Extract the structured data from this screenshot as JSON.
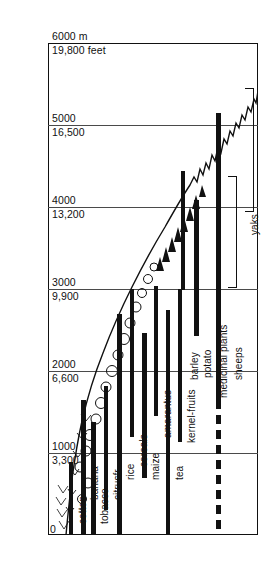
{
  "figure": {
    "title": "Altitudinal zonation of crops and livestock in the Himalaya",
    "unit_primary": "m",
    "unit_secondary": "feet"
  },
  "axis": {
    "ticks": [
      {
        "meters": "6000 m",
        "feet": "19,800 feet",
        "y": 43
      },
      {
        "meters": "5000",
        "feet": "16,500",
        "y": 125
      },
      {
        "meters": "4000",
        "feet": "13,200",
        "y": 207
      },
      {
        "meters": "3000",
        "feet": "9,900",
        "y": 289
      },
      {
        "meters": "2000",
        "feet": "6,600",
        "y": 371
      },
      {
        "meters": "1000",
        "feet": "3,300",
        "y": 453
      },
      {
        "meters": "0",
        "feet": "",
        "y": 535
      }
    ]
  },
  "chart_data": {
    "type": "bar",
    "title": "Altitudinal zonation of crops and livestock in the Himalaya",
    "xlabel": "",
    "ylabel": "Elevation",
    "ylim": [
      0,
      6000
    ],
    "ytick_meters": [
      0,
      1000,
      2000,
      3000,
      4000,
      5000,
      6000
    ],
    "ytick_feet": [
      "0",
      "3,300",
      "6,600",
      "9,900",
      "13,200",
      "16,500",
      "19,800 feet"
    ],
    "grid": true,
    "orientation": "vertical-ranges",
    "categories": [
      "cotton",
      "banana",
      "tobacco",
      "citrusfr.",
      "rice",
      "cereals",
      "maize",
      "amarantus",
      "tea",
      "kernel-fruits",
      "potato",
      "barley",
      "medicinal plants",
      "sheeps",
      "yaks"
    ],
    "series": [
      {
        "name": "cotton",
        "kind": "bar",
        "min_m": 0,
        "max_m": 600,
        "x": 69,
        "y_top": 462,
        "y_bottom": 535,
        "width": 4,
        "style": "solid"
      },
      {
        "name": "banana",
        "kind": "bar",
        "min_m": 0,
        "max_m": 1650,
        "x": 81,
        "y_top": 400,
        "y_bottom": 535,
        "width": 5,
        "style": "solid"
      },
      {
        "name": "tobacco",
        "kind": "bar",
        "min_m": 0,
        "max_m": 1380,
        "x": 91,
        "y_top": 422,
        "y_bottom": 535,
        "width": 5,
        "style": "solid"
      },
      {
        "name": "citrusfr.",
        "kind": "bar",
        "min_m": 300,
        "max_m": 1820,
        "x": 104,
        "y_top": 386,
        "y_bottom": 510,
        "width": 4,
        "style": "solid"
      },
      {
        "name": "rice",
        "kind": "bar",
        "min_m": 0,
        "max_m": 2700,
        "x": 117,
        "y_top": 314,
        "y_bottom": 535,
        "width": 5,
        "style": "solid"
      },
      {
        "name": "cereals",
        "kind": "bar",
        "min_m": 1200,
        "max_m": 3250,
        "x": 130,
        "y_top": 289,
        "y_bottom": 437,
        "width": 4,
        "style": "solid"
      },
      {
        "name": "maize",
        "kind": "bar",
        "min_m": 700,
        "max_m": 2450,
        "x": 142,
        "y_top": 333,
        "y_bottom": 478,
        "width": 5,
        "style": "solid"
      },
      {
        "name": "amarantus",
        "kind": "bar",
        "min_m": 1700,
        "max_m": 3300,
        "x": 154,
        "y_top": 286,
        "y_bottom": 416,
        "width": 4,
        "style": "solid"
      },
      {
        "name": "tea",
        "kind": "bar",
        "min_m": 0,
        "max_m": 2750,
        "x": 166,
        "y_top": 310,
        "y_bottom": 535,
        "width": 4,
        "style": "solid"
      },
      {
        "name": "kernel-fruits",
        "kind": "bar",
        "min_m": 1150,
        "max_m": 3250,
        "x": 178,
        "y_top": 289,
        "y_bottom": 442,
        "width": 4,
        "style": "solid"
      },
      {
        "name": "potato",
        "kind": "bar",
        "min_m": 2450,
        "max_m": 4100,
        "x": 194,
        "y_top": 200,
        "y_bottom": 336,
        "width": 5,
        "style": "solid"
      },
      {
        "name": "barley",
        "kind": "bar",
        "min_m": 3000,
        "max_m": 4450,
        "x": 181,
        "y_top": 171,
        "y_bottom": 290,
        "width": 4,
        "style": "solid"
      },
      {
        "name": "medicinal plants",
        "kind": "bar",
        "min_m": 0,
        "max_m": 5150,
        "x": 216,
        "y_top": 113,
        "y_bottom": 535,
        "width": 5,
        "style": "solid-then-dashed",
        "solid_to_y": 400
      },
      {
        "name": "sheeps",
        "kind": "bracket",
        "min_m": 1500,
        "max_m": 3150,
        "x": 228,
        "y_top": 176,
        "y_bottom": 288
      },
      {
        "name": "yaks",
        "kind": "bracket",
        "min_m": 3200,
        "max_m": 5000,
        "x": 245,
        "y_top": 88,
        "y_bottom": 212
      }
    ]
  },
  "labels": [
    {
      "text": "cotton",
      "x": 70,
      "y": 524
    },
    {
      "text": "banana",
      "x": 82,
      "y": 500
    },
    {
      "text": "tobacco",
      "x": 92,
      "y": 524
    },
    {
      "text": "citrusfr.",
      "x": 105,
      "y": 500
    },
    {
      "text": "rice",
      "x": 118,
      "y": 480
    },
    {
      "text": "cereals",
      "x": 131,
      "y": 467
    },
    {
      "text": "maize",
      "x": 143,
      "y": 480
    },
    {
      "text": "amarantus",
      "x": 155,
      "y": 438
    },
    {
      "text": "tea",
      "x": 167,
      "y": 480
    },
    {
      "text": "kernel-fruits",
      "x": 179,
      "y": 443
    },
    {
      "text": "potato",
      "x": 195,
      "y": 378
    },
    {
      "text": "barley",
      "x": 182,
      "y": 380
    },
    {
      "text": "medicinal plants",
      "x": 211,
      "y": 398
    },
    {
      "text": "sheeps",
      "x": 226,
      "y": 380
    },
    {
      "text": "yaks",
      "x": 242,
      "y": 235
    }
  ]
}
